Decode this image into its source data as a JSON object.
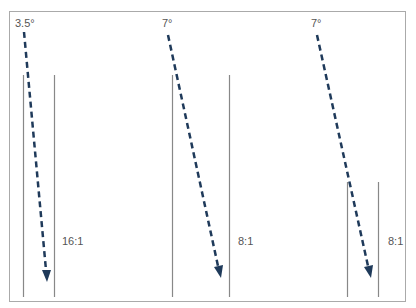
{
  "figure": {
    "colors": {
      "frame": "#aaaaaa",
      "strip": "#888888",
      "arrow": "#1f3a5a",
      "text": "#555555"
    },
    "panels": [
      {
        "angle_label": "3.5°",
        "ratio_label": "16:1"
      },
      {
        "angle_label": "7°",
        "ratio_label": "8:1"
      },
      {
        "angle_label": "7°",
        "ratio_label": "8:1"
      }
    ]
  }
}
